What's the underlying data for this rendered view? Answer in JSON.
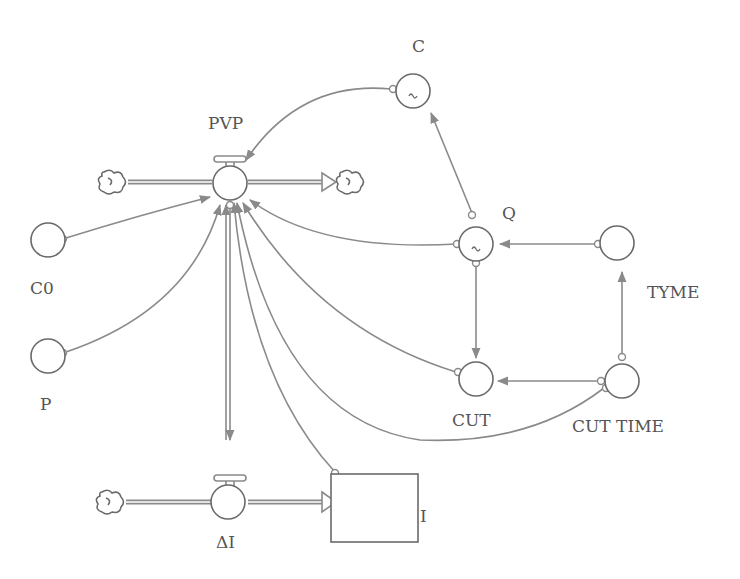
{
  "diagram": {
    "type": "stock-and-flow",
    "colors": {
      "line": "#8a8a8a",
      "node": "#6a6a6a",
      "text": "#555555",
      "background": "#ffffff"
    },
    "nodes": {
      "pvp": {
        "label": "PVP",
        "kind": "flow"
      },
      "delta_i": {
        "label": "ΔI",
        "kind": "flow"
      },
      "i": {
        "label": "I",
        "kind": "stock"
      },
      "c": {
        "label": "C",
        "kind": "auxiliary",
        "graphical": true,
        "glyph": "~"
      },
      "q": {
        "label": "Q",
        "kind": "auxiliary",
        "graphical": true,
        "glyph": "~"
      },
      "c0": {
        "label": "C0",
        "kind": "auxiliary"
      },
      "p": {
        "label": "P",
        "kind": "auxiliary"
      },
      "tyme": {
        "label": "TYME",
        "kind": "auxiliary"
      },
      "cut": {
        "label": "CUT",
        "kind": "auxiliary"
      },
      "cut_time": {
        "label": "CUT TIME",
        "kind": "auxiliary"
      }
    },
    "clouds": [
      "pvp-source",
      "pvp-sink",
      "delta-i-source"
    ],
    "connectors": [
      {
        "from": "C0",
        "to": "PVP"
      },
      {
        "from": "P",
        "to": "PVP"
      },
      {
        "from": "C",
        "to": "PVP"
      },
      {
        "from": "Q",
        "to": "C"
      },
      {
        "from": "Q",
        "to": "PVP"
      },
      {
        "from": "Q",
        "to": "CUT"
      },
      {
        "from": "TYME",
        "to": "Q"
      },
      {
        "from": "CUT TIME",
        "to": "TYME"
      },
      {
        "from": "CUT TIME",
        "to": "CUT"
      },
      {
        "from": "CUT",
        "to": "PVP"
      },
      {
        "from": "CUT TIME",
        "to": "PVP"
      },
      {
        "from": "I",
        "to": "PVP"
      },
      {
        "from": "PVP",
        "to": "ΔI"
      },
      {
        "from": "ΔI",
        "to": "PVP"
      }
    ]
  }
}
